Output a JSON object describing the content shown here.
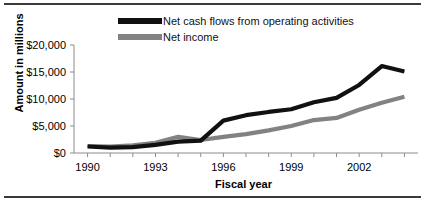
{
  "chart_data": {
    "type": "line",
    "title": "",
    "xlabel": "Fiscal year",
    "ylabel": "Amount in millions",
    "x": [
      1990,
      1991,
      1992,
      1993,
      1994,
      1995,
      1996,
      1997,
      1998,
      1999,
      2000,
      2001,
      2002,
      2003,
      2004
    ],
    "xlim": [
      1989.4,
      2004.6
    ],
    "ylim": [
      0,
      20000
    ],
    "xticks": [
      1990,
      1993,
      1996,
      1999,
      2002
    ],
    "xtick_labels": [
      "1990",
      "1993",
      "1996",
      "1999",
      "2002"
    ],
    "yticks": [
      0,
      5000,
      10000,
      15000,
      20000
    ],
    "ytick_labels": [
      "$0",
      "$5,000",
      "$10,000",
      "$15,000",
      "$20,000"
    ],
    "grid": false,
    "legend_position": "top",
    "series": [
      {
        "name": "Net cash flows from operating activities",
        "color": "#111111",
        "values": [
          1200,
          1000,
          1100,
          1500,
          2100,
          2300,
          6000,
          7000,
          7600,
          8100,
          9400,
          10200,
          12600,
          16100,
          15100
        ]
      },
      {
        "name": "Net income",
        "color": "#828282",
        "values": [
          1300,
          1200,
          1400,
          1900,
          3000,
          2400,
          3000,
          3500,
          4200,
          5000,
          6100,
          6500,
          8000,
          9300,
          10400
        ]
      }
    ]
  },
  "legend": {
    "items": [
      {
        "label": "Net cash flows from operating activities"
      },
      {
        "label": "Net income"
      }
    ]
  },
  "axes": {
    "x_title": "Fiscal year",
    "y_title": "Amount in millions"
  }
}
